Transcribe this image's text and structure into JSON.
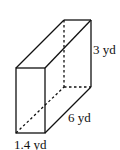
{
  "figure": {
    "type": "rectangular-prism",
    "labels": {
      "height": "3 yd",
      "length": "6 yd",
      "width": "1.4 yd"
    },
    "colors": {
      "stroke": "#111111",
      "background": "#ffffff"
    }
  }
}
